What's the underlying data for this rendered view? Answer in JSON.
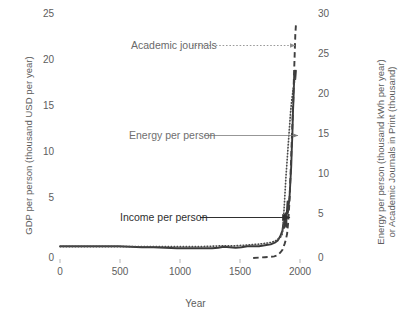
{
  "chart_data": {
    "type": "line",
    "title": "",
    "xlabel": "Year",
    "ylabel": "GDP per person (thousand USD per year)",
    "ylabel_right": "Energy per person (thousand kWh per year) or Academic Journals in Print (thousand)",
    "ylabel_right_line1": "Energy per person (thousand kWh per year)",
    "ylabel_right_line2": "or Academic Journals in Print (thousand)",
    "xlim": [
      0,
      2050
    ],
    "ylim": [
      0,
      25
    ],
    "ylim_right": [
      0,
      30
    ],
    "xticks": [
      0,
      500,
      1000,
      1500,
      2000
    ],
    "xtick_labels": [
      "0",
      "500",
      "1000",
      "1500",
      "2000"
    ],
    "yticks": [
      0,
      5,
      10,
      15,
      20,
      25
    ],
    "ytick_labels": [
      "0",
      "5",
      "10",
      "15",
      "20",
      "25"
    ],
    "yticks_right": [
      0,
      5,
      10,
      15,
      20,
      25,
      30
    ],
    "ytick_labels_right": [
      "0",
      "5",
      "10",
      "15",
      "20",
      "25",
      "30"
    ],
    "grid": false,
    "legend_position": "inline-annotations",
    "series": [
      {
        "name": "Income per person",
        "axis": "left",
        "style": "solid",
        "color": "#3a3a3a",
        "x": [
          1,
          100,
          200,
          300,
          400,
          500,
          600,
          700,
          800,
          900,
          1000,
          1100,
          1200,
          1300,
          1350,
          1400,
          1450,
          1500,
          1550,
          1600,
          1650,
          1700,
          1750,
          1800,
          1820,
          1840,
          1860,
          1870,
          1880,
          1890,
          1900,
          1905,
          1910,
          1915,
          1918,
          1920,
          1925,
          1929,
          1932,
          1935,
          1938,
          1940,
          1944,
          1946,
          1950,
          1955,
          1960,
          1965,
          1970,
          1975,
          1980,
          1985,
          1990,
          1995,
          2000,
          2005,
          2010,
          2015
        ],
        "y": [
          1.2,
          1.2,
          1.2,
          1.2,
          1.2,
          1.2,
          1.15,
          1.1,
          1.1,
          1.05,
          1.0,
          1.0,
          1.0,
          1.0,
          1.05,
          1.15,
          1.1,
          1.05,
          1.1,
          1.2,
          1.2,
          1.2,
          1.3,
          1.4,
          1.5,
          1.6,
          1.8,
          2.0,
          2.2,
          2.5,
          2.8,
          3.3,
          3.6,
          3.1,
          4.4,
          3.6,
          4.4,
          4.6,
          3.2,
          4.1,
          4.7,
          5.1,
          5.8,
          4.6,
          5.0,
          5.6,
          6.1,
          7.2,
          8.3,
          9.4,
          11.2,
          12.7,
          15.0,
          16.4,
          18.6,
          19.2,
          18.4,
          19.2
        ]
      },
      {
        "name": "Energy per person",
        "axis": "right",
        "style": "dotted",
        "color": "#4a4a4a",
        "x": [
          1,
          200,
          400,
          600,
          800,
          1000,
          1200,
          1400,
          1500,
          1600,
          1650,
          1700,
          1750,
          1800,
          1820,
          1840,
          1850,
          1860,
          1870,
          1880,
          1890,
          1900,
          1910,
          1920,
          1930,
          1940,
          1950,
          1960,
          1970,
          1980,
          1990,
          2000,
          2010,
          2015
        ],
        "y": [
          1.4,
          1.4,
          1.4,
          1.4,
          1.4,
          1.4,
          1.4,
          1.5,
          1.5,
          1.6,
          1.65,
          1.7,
          1.8,
          1.9,
          2.0,
          2.1,
          2.2,
          2.3,
          2.4,
          2.5,
          2.7,
          3.0,
          5.0,
          7.5,
          10.0,
          12.0,
          14.0,
          16.0,
          18.0,
          19.5,
          20.5,
          21.5,
          22.0,
          21.8
        ]
      },
      {
        "name": "Academic journals",
        "axis": "right",
        "style": "dashed",
        "color": "#3f3f3f",
        "x": [
          1650,
          1700,
          1750,
          1800,
          1830,
          1850,
          1870,
          1890,
          1900,
          1910,
          1920,
          1930,
          1940,
          1950,
          1960,
          1970,
          1980,
          1990,
          2000,
          2010,
          2015
        ],
        "y": [
          0.0,
          0.05,
          0.1,
          0.15,
          0.2,
          0.3,
          0.5,
          0.8,
          1.0,
          1.4,
          1.8,
          2.3,
          3.0,
          4.5,
          7.0,
          10.5,
          14.5,
          18.5,
          23.0,
          27.5,
          28.6
        ]
      }
    ],
    "annotations": [
      {
        "name": "Academic journals",
        "text": "Academic journals",
        "arrow_style": "dotted",
        "arrow_color": "#8f8f8f",
        "text_color": "#6a6a6a"
      },
      {
        "name": "Energy per person",
        "text": "Energy per person",
        "arrow_style": "solid-thin",
        "arrow_color": "#7f7f7f",
        "text_color": "#6f6f6f"
      },
      {
        "name": "Income per person",
        "text": "Income per person",
        "arrow_style": "solid-bold",
        "arrow_color": "#2f2f2f",
        "text_color": "#2f2f2f"
      }
    ]
  },
  "axes": {
    "x_title": "Year",
    "y_left_title": "GDP per person (thousand USD per year)",
    "y_right_title_line1": "Energy per person (thousand kWh per year)",
    "y_right_title_line2": "or Academic Journals in Print (thousand)"
  },
  "ticks": {
    "left": [
      "25",
      "20",
      "15",
      "10",
      "5",
      "0"
    ],
    "right": [
      "30",
      "25",
      "20",
      "15",
      "10",
      "5",
      "0"
    ],
    "bottom": [
      "0",
      "500",
      "1000",
      "1500",
      "2000"
    ]
  },
  "colors": {
    "text": "#5d5d5d",
    "income_line": "#3a3a3a",
    "energy_line": "#4a4a4a",
    "journals_line": "#3f3f3f",
    "background": "#ffffff"
  }
}
